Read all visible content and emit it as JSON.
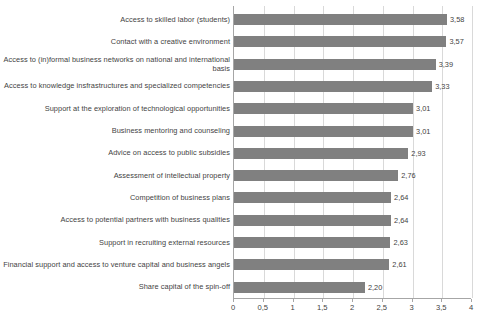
{
  "chart_data": {
    "type": "bar",
    "orientation": "horizontal",
    "title": "",
    "subtitle": "",
    "xlabel": "",
    "ylabel": "",
    "xlim": [
      0,
      4
    ],
    "grid": true,
    "legend": false,
    "decimal_separator": ",",
    "bar_color": "#808080",
    "gridline_color": "#d9d9d9",
    "axis_color": "#a6a6a6",
    "text_color": "#3f3f3f",
    "xticks": [
      0,
      0.5,
      1,
      1.5,
      2,
      2.5,
      3,
      3.5,
      4
    ],
    "xtick_labels": [
      "0",
      "0,5",
      "1",
      "1,5",
      "2",
      "2,5",
      "3",
      "3,5",
      "4"
    ],
    "categories": [
      "Access to skilled labor (students)",
      "Contact with a creative environment",
      "Access to (in)formal business networks on national and international basis",
      "Access to knowledge insfrastructures and specialized competencies",
      "Support at the exploration of technological opportunities",
      "Business mentoring and counseling",
      "Advice on access to public subsidies",
      "Assessment of intellectual property",
      "Competition of business plans",
      "Access to potential partners with business qualities",
      "Support in recruiting external resources",
      "Financial support and access to venture capital and business angels",
      "Share capital of the spin-off"
    ],
    "values": [
      3.58,
      3.57,
      3.39,
      3.33,
      3.01,
      3.01,
      2.93,
      2.76,
      2.64,
      2.64,
      2.63,
      2.61,
      2.2
    ],
    "value_labels": [
      "3,58",
      "3,57",
      "3,39",
      "3,33",
      "3,01",
      "3,01",
      "2,93",
      "2,76",
      "2,64",
      "2,64",
      "2,63",
      "2,61",
      "2,20"
    ]
  }
}
